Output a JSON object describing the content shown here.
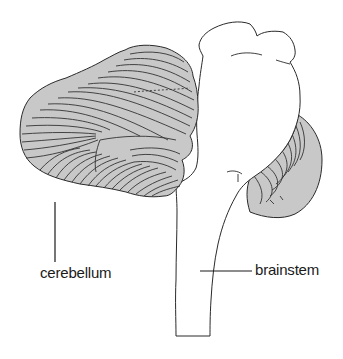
{
  "figure": {
    "type": "anatomical line drawing",
    "colors": {
      "background": "#ffffff",
      "cerebellum_fill": "#c8c8c8",
      "outline": "#2a2a2a",
      "folia_lines": "#333333",
      "label_text": "#1a1a1a"
    }
  },
  "labels": {
    "cerebellum": "cerebellum",
    "brainstem": "brainstem"
  }
}
